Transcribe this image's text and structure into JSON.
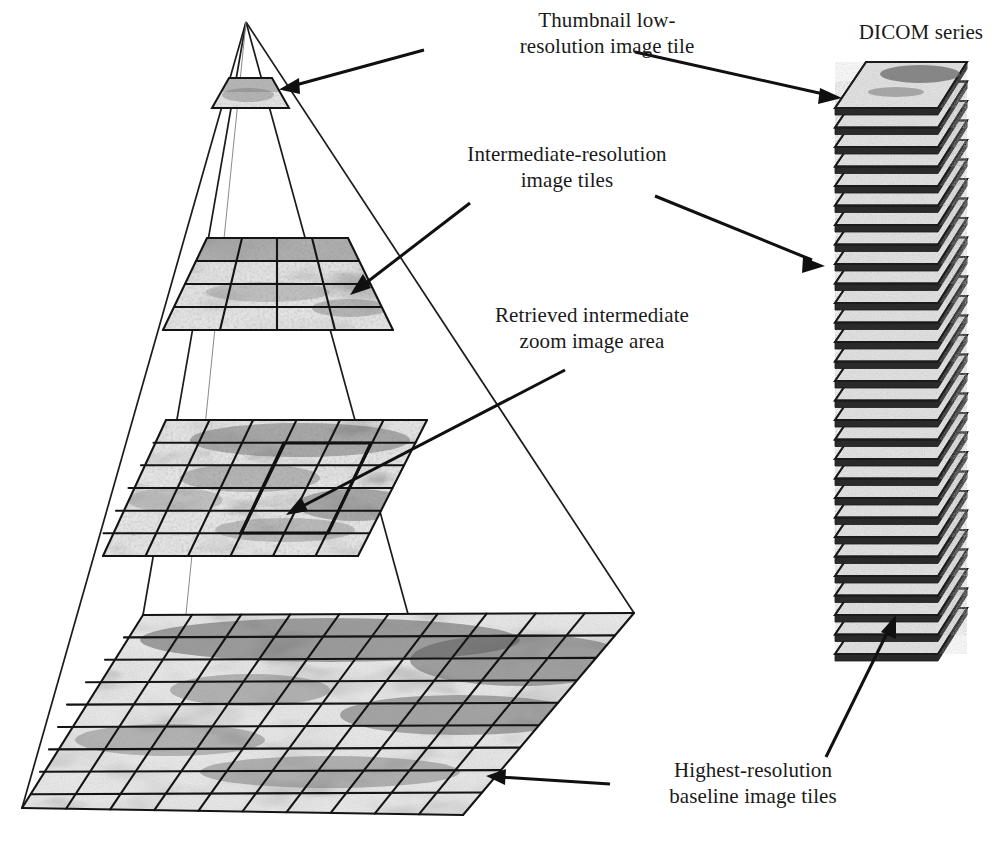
{
  "figure": {
    "background_color": "#ffffff",
    "ink_color": "#1a1a1a",
    "width": 995,
    "height": 843
  },
  "annotations": {
    "thumbnail": "Thumbnail low-\nresolution image tile",
    "intermediate": "Intermediate-resolution\nimage tiles",
    "retrieved": "Retrieved intermediate\nzoom image area",
    "highest": "Highest-resolution\nbaseline image tiles",
    "dicom": "DICOM series"
  },
  "chart_data": {
    "type": "diagram",
    "levels": [
      {
        "name": "thumbnail",
        "label": "Thumbnail low-resolution image tile",
        "grid_cols": 1,
        "grid_rows": 1,
        "tiles": 1,
        "y_center": 94
      },
      {
        "name": "intermediate",
        "label": "Intermediate-resolution image tiles",
        "grid_cols": 4,
        "grid_rows": 4,
        "tiles": 16,
        "y_center": 285
      },
      {
        "name": "retrieved",
        "label": "Retrieved intermediate zoom image area",
        "grid_cols": 6,
        "grid_rows": 6,
        "tiles": 36,
        "roi_cols": 2,
        "roi_rows": 2,
        "y_center": 487
      },
      {
        "name": "baseline",
        "label": "Highest-resolution baseline image tiles",
        "grid_cols": 10,
        "grid_rows": 9,
        "tiles": 90,
        "y_center": 714
      }
    ],
    "dicom_series": {
      "label": "DICOM series",
      "slice_count": 29,
      "top_slice_has_tissue": true
    },
    "arrows": [
      {
        "from": "thumbnail-label",
        "to": "thumbnail-tile"
      },
      {
        "from": "intermediate-label",
        "to": "intermediate-level"
      },
      {
        "from": "intermediate-label",
        "to": "dicom-series"
      },
      {
        "from": "thumbnail-label",
        "to": "dicom-series-top"
      },
      {
        "from": "retrieved-label",
        "to": "retrieved-roi"
      },
      {
        "from": "highest-label",
        "to": "baseline-level"
      },
      {
        "from": "baseline-level",
        "to": "dicom-series-bottom"
      }
    ]
  }
}
